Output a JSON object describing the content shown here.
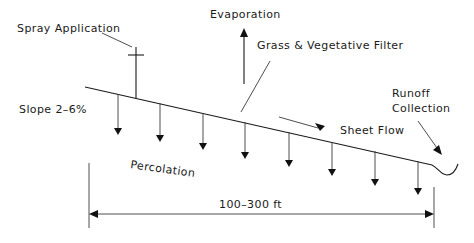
{
  "diagram": {
    "labels": {
      "spray": "Spray Application",
      "evaporation": "Evaporation",
      "grass": "Grass & Vegetative Filter",
      "slope": "Slope 2–6%",
      "runoff_line1": "Runoff",
      "runoff_line2": "Collection",
      "sheet_flow": "Sheet Flow",
      "percolation": "Percolation",
      "distance": "100–300 ft"
    },
    "percolation_arrow_count": 8,
    "colors": {
      "background": "#ffffff",
      "ink": "#1a1a1a"
    }
  }
}
